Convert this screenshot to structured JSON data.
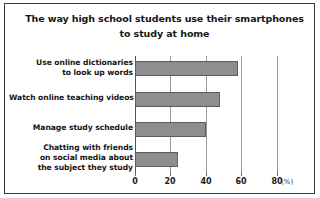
{
  "chart_data": {
    "type": "bar",
    "orientation": "horizontal",
    "title": "The way high school students use their smartphones to study at home",
    "title_lines": [
      "The way high school students use their smartphones",
      "to study at home"
    ],
    "categories": [
      "Use online dictionaries to look up words",
      "Watch online teaching videos",
      "Manage study schedule",
      "Chatting with friends on social media about the subject they study"
    ],
    "category_lines": [
      [
        "Use online dictionaries",
        "to look up words"
      ],
      [
        "Watch online teaching videos"
      ],
      [
        "Manage study schedule"
      ],
      [
        "Chatting with friends",
        "on social media about",
        "the subject they study"
      ]
    ],
    "values": [
      58,
      48,
      40,
      24
    ],
    "xlabel": "",
    "ylabel": "",
    "unit": "(%)",
    "xlim": [
      0,
      80
    ],
    "xticks": [
      0,
      20,
      40,
      60,
      80
    ],
    "xtick_labels": [
      "0",
      "20",
      "40",
      "60",
      "80"
    ],
    "grid": true,
    "legend": false,
    "bar_color": "#8e8e8e",
    "bar_edge_color": "#5d5d5d",
    "grid_color": "#9a9a9a",
    "axis_color": "#555555",
    "text_color": "#141414",
    "background": "#ffffff",
    "frame_color": "#3a3a3a"
  }
}
